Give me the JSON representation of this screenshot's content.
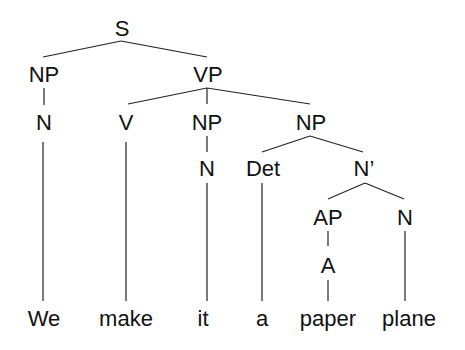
{
  "tree": {
    "nodes": [
      {
        "id": "S",
        "label": "S",
        "x": 122,
        "y": 36
      },
      {
        "id": "NP1",
        "label": "NP",
        "x": 44,
        "y": 82
      },
      {
        "id": "VP",
        "label": "VP",
        "x": 208,
        "y": 82
      },
      {
        "id": "N1",
        "label": "N",
        "x": 44,
        "y": 130
      },
      {
        "id": "V",
        "label": "V",
        "x": 126,
        "y": 130
      },
      {
        "id": "NP2",
        "label": "NP",
        "x": 207,
        "y": 130
      },
      {
        "id": "NP3",
        "label": "NP",
        "x": 311,
        "y": 130
      },
      {
        "id": "N2",
        "label": "N",
        "x": 207,
        "y": 176
      },
      {
        "id": "Det",
        "label": "Det",
        "x": 263,
        "y": 176
      },
      {
        "id": "Nbar",
        "label": "N’",
        "x": 364,
        "y": 176
      },
      {
        "id": "AP",
        "label": "AP",
        "x": 328,
        "y": 225
      },
      {
        "id": "N3",
        "label": "N",
        "x": 405,
        "y": 225
      },
      {
        "id": "A",
        "label": "A",
        "x": 328,
        "y": 273
      }
    ],
    "words": [
      {
        "label": "We",
        "x": 44,
        "y": 326
      },
      {
        "label": "make",
        "x": 126,
        "y": 326
      },
      {
        "label": "it",
        "x": 203,
        "y": 326
      },
      {
        "label": "a",
        "x": 262,
        "y": 326
      },
      {
        "label": "paper",
        "x": 328,
        "y": 326
      },
      {
        "label": "plane",
        "x": 409,
        "y": 326
      }
    ],
    "edges": [
      [
        121,
        41,
        43,
        57
      ],
      [
        121,
        41,
        207,
        57
      ],
      [
        44,
        88,
        44,
        105
      ],
      [
        207,
        88,
        128,
        104
      ],
      [
        207,
        88,
        207,
        104
      ],
      [
        207,
        88,
        310,
        104
      ],
      [
        43,
        142,
        43,
        301
      ],
      [
        126,
        142,
        126,
        301
      ],
      [
        207,
        136,
        207,
        152
      ],
      [
        310,
        136,
        262,
        152
      ],
      [
        310,
        136,
        363,
        152
      ],
      [
        207,
        183,
        207,
        301
      ],
      [
        262,
        183,
        262,
        301
      ],
      [
        365,
        183,
        328,
        199
      ],
      [
        365,
        183,
        404,
        199
      ],
      [
        328,
        231,
        328,
        246
      ],
      [
        328,
        280,
        328,
        301
      ],
      [
        405,
        231,
        405,
        301
      ]
    ]
  }
}
